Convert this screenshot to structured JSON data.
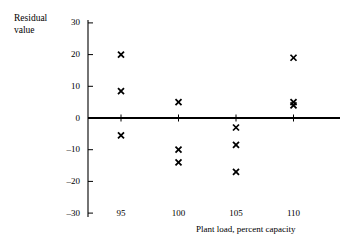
{
  "chart_data": {
    "type": "scatter",
    "title": "",
    "xlabel": "Plant load, percent capacity",
    "ylabel": "Residual value",
    "ylabel_lines": [
      "Residual",
      "value"
    ],
    "xlim": [
      92.5,
      112.5
    ],
    "ylim": [
      -30,
      30
    ],
    "xticks": [
      95,
      100,
      105,
      110
    ],
    "xtick_labels": [
      "95",
      "100",
      "105",
      "110"
    ],
    "yticks": [
      -30,
      -20,
      -10,
      0,
      10,
      20,
      30
    ],
    "ytick_labels": [
      "30",
      "20",
      "10",
      "0",
      "–10",
      "–20",
      "–30"
    ],
    "grid": false,
    "legend": false,
    "marker": "x",
    "marker_color": "#000000",
    "zero_line": true,
    "x": [
      95,
      95,
      95,
      100,
      100,
      100,
      105,
      105,
      105,
      110,
      110,
      110
    ],
    "y": [
      20,
      8.5,
      -5.5,
      5,
      -10,
      -14,
      -3,
      -8.5,
      -17,
      19,
      5,
      4
    ],
    "points": [
      {
        "x": 95,
        "y": 20
      },
      {
        "x": 95,
        "y": 8.5
      },
      {
        "x": 95,
        "y": -5.5
      },
      {
        "x": 100,
        "y": 5
      },
      {
        "x": 100,
        "y": -10
      },
      {
        "x": 100,
        "y": -14
      },
      {
        "x": 105,
        "y": -3
      },
      {
        "x": 105,
        "y": -8.5
      },
      {
        "x": 105,
        "y": -17
      },
      {
        "x": 110,
        "y": 19
      },
      {
        "x": 110,
        "y": 5
      },
      {
        "x": 110,
        "y": 4
      }
    ]
  },
  "axes": {
    "y_axis_name": "residual-value-axis",
    "x_axis_name": "plant-load-axis"
  }
}
